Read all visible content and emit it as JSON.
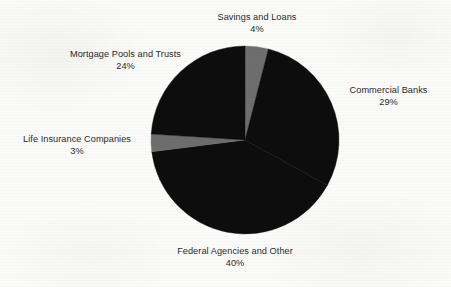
{
  "chart_data": {
    "type": "pie",
    "title": "",
    "subtitle": "",
    "xlabel": "",
    "ylabel": "",
    "legend_position": "none",
    "labels_position": "outside",
    "grid": false,
    "units": "percent",
    "start_angle_deg": 0,
    "direction": "clockwise",
    "categories": [
      "Savings and Loans",
      "Commercial Banks",
      "Federal Agencies and Other",
      "Life Insurance Companies",
      "Mortgage Pools and Trusts"
    ],
    "values": [
      4,
      29,
      40,
      3,
      24
    ],
    "slices": [
      {
        "name": "Savings and Loans",
        "value": 4,
        "pct_text": "4%",
        "color": "#6e6e6e",
        "start_deg": 0,
        "end_deg": 14.4
      },
      {
        "name": "Commercial Banks",
        "value": 29,
        "pct_text": "29%",
        "color": "#0d0d0d",
        "start_deg": 14.4,
        "end_deg": 118.8
      },
      {
        "name": "Federal Agencies and Other",
        "value": 40,
        "pct_text": "40%",
        "color": "#0d0d0d",
        "start_deg": 118.8,
        "end_deg": 262.8
      },
      {
        "name": "Life Insurance Companies",
        "value": 3,
        "pct_text": "3%",
        "color": "#6e6e6e",
        "start_deg": 262.8,
        "end_deg": 273.6
      },
      {
        "name": "Mortgage Pools and Trusts",
        "value": 24,
        "pct_text": "24%",
        "color": "#0d0d0d",
        "start_deg": 273.6,
        "end_deg": 360
      }
    ],
    "geometry": {
      "center_x": 245,
      "center_y": 140,
      "radius": 94
    },
    "colors": {
      "background": "#fbfbfa",
      "dark_slice": "#0d0d0d",
      "gray_slice": "#6e6e6e",
      "label_text": "#2a2a2a"
    }
  }
}
